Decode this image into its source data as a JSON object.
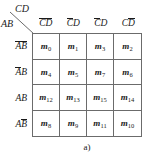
{
  "figure": {
    "type": "karnaugh-map",
    "caption": "a)",
    "corner": {
      "column_variables": "CD",
      "row_variables": "AB"
    },
    "columns": [
      {
        "id": "col-0",
        "text": "CD",
        "overline": "both",
        "code": "00"
      },
      {
        "id": "col-1",
        "text": "CD",
        "overline": "first",
        "code": "01"
      },
      {
        "id": "col-2",
        "text": "CD",
        "overline": "first",
        "code": "01"
      },
      {
        "id": "col-3",
        "text": "CD",
        "overline": "second",
        "code": "10"
      }
    ],
    "column_labels_plain": [
      "C̄D̄",
      "C̄D",
      "C̄D",
      "CD̄"
    ],
    "rows": [
      {
        "id": "row-0",
        "text": "AB",
        "overline": "both",
        "code": "00"
      },
      {
        "id": "row-1",
        "text": "AB",
        "overline": "first",
        "code": "01"
      },
      {
        "id": "row-2",
        "text": "AB",
        "overline": "none",
        "code": "11"
      },
      {
        "id": "row-3",
        "text": "AB",
        "overline": "second",
        "code": "10"
      }
    ],
    "row_labels_plain": [
      "ĀB̄",
      "ĀB",
      "AB",
      "AB̄"
    ],
    "cells": [
      [
        {
          "symbol": "m",
          "index": "0"
        },
        {
          "symbol": "m",
          "index": "1"
        },
        {
          "symbol": "m",
          "index": "3"
        },
        {
          "symbol": "m",
          "index": "2"
        }
      ],
      [
        {
          "symbol": "m",
          "index": "4"
        },
        {
          "symbol": "m",
          "index": "5"
        },
        {
          "symbol": "m",
          "index": "7"
        },
        {
          "symbol": "m",
          "index": "6"
        }
      ],
      [
        {
          "symbol": "m",
          "index": "12"
        },
        {
          "symbol": "m",
          "index": "13"
        },
        {
          "symbol": "m",
          "index": "15"
        },
        {
          "symbol": "m",
          "index": "14"
        }
      ],
      [
        {
          "symbol": "m",
          "index": "8"
        },
        {
          "symbol": "m",
          "index": "9"
        },
        {
          "symbol": "m",
          "index": "11"
        },
        {
          "symbol": "m",
          "index": "10"
        }
      ]
    ],
    "colors": {
      "grid_line": "#6b6b6b",
      "text": "#1a1a1a",
      "background": "#ffffff"
    }
  }
}
